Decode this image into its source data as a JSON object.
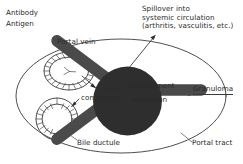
{
  "diagram": {
    "ink_color": "#3a3a3a",
    "background_color": "#ffffff"
  },
  "legend": {
    "items": [
      {
        "icon": "antibody-y-glyph",
        "label": "Antibody"
      },
      {
        "icon": "antigen-dot-glyph",
        "label": "Antigen"
      }
    ]
  },
  "labels": {
    "portal_vein": "Portal vein",
    "bile_ductule": "Bile ductule",
    "portal_tract": "Portal tract",
    "large_complexes_line1": "Large",
    "large_complexes_line2": "complexes",
    "complement_line1": "Complement",
    "complement_line2": "activation",
    "granuloma": "Granuloma",
    "spillover_line1": "Spillover into",
    "spillover_line2": "systemic circulation",
    "spillover_line3": "(arthritis, vasculitis, etc.)"
  },
  "structures": {
    "portal_tract_shape": "large-ellipse",
    "portal_vein_shape": "ellipse-with-radial-cells",
    "bile_ductule_shape": "circle-with-radial-cells"
  }
}
